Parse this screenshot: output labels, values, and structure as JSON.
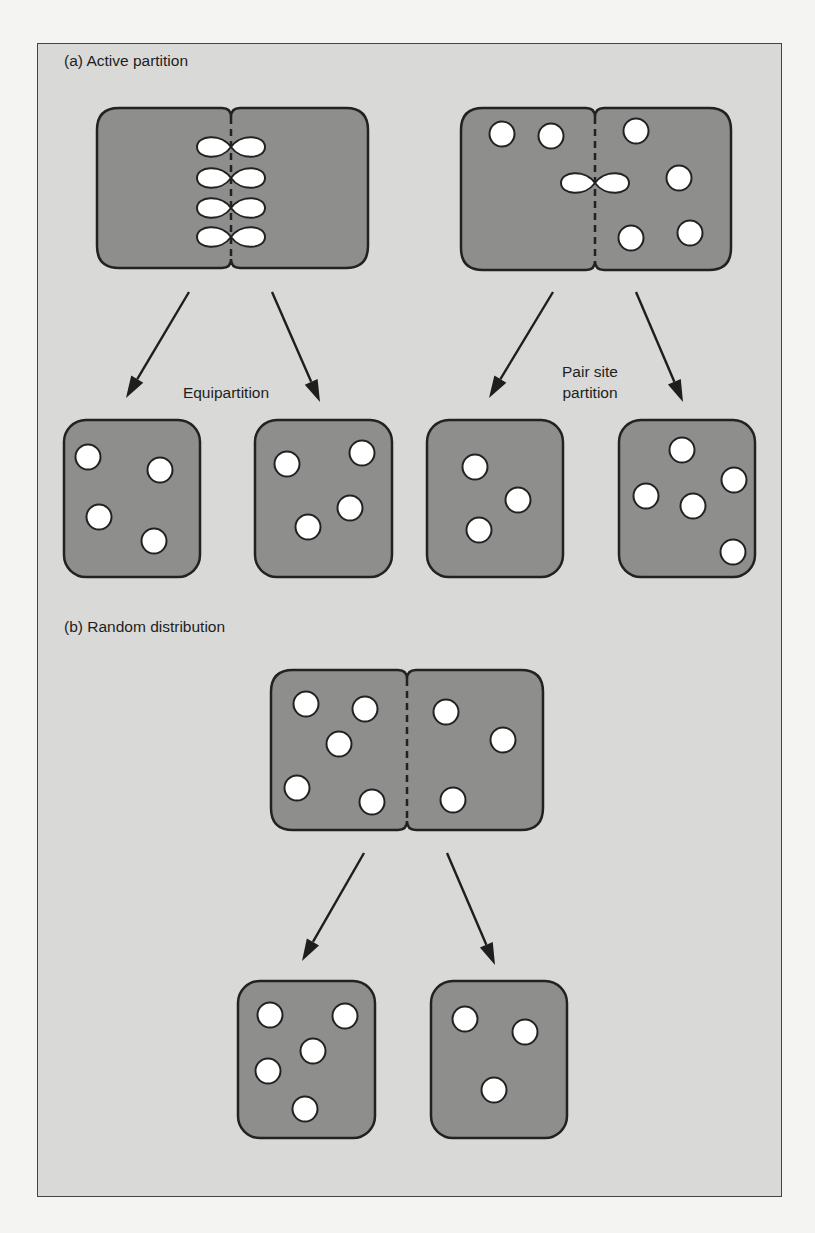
{
  "figure": {
    "panel_a_title": "(a)  Active partition",
    "panel_b_title": "(b) Random distribution",
    "equipartition_label": "Equipartition",
    "pair_site_label_line1": "Pair site",
    "pair_site_label_line2": "partition"
  },
  "colors": {
    "frame_bg": "#d9d9d7",
    "cell_fill": "#8e8e8c",
    "outline": "#222222",
    "particle_fill": "#ffffff"
  },
  "cells": {
    "dividing": [
      {
        "id": "active-equipartition-parent",
        "x": 97,
        "y": 108,
        "w": 271,
        "h": 160,
        "division_x": 231,
        "pairs_y": [
          147,
          178,
          208,
          237
        ],
        "particles": []
      },
      {
        "id": "active-pairsite-parent",
        "x": 461,
        "y": 108,
        "w": 270,
        "h": 162,
        "division_x": 595,
        "pairs_y": [
          183
        ],
        "particles": [
          [
            502,
            134
          ],
          [
            551,
            136
          ],
          [
            636,
            131
          ],
          [
            679,
            178
          ],
          [
            690,
            233
          ],
          [
            631,
            238
          ]
        ]
      },
      {
        "id": "random-parent",
        "x": 271,
        "y": 670,
        "w": 272,
        "h": 160,
        "division_x": 407,
        "pairs_y": [],
        "particles": [
          [
            306,
            704
          ],
          [
            365,
            709
          ],
          [
            339,
            744
          ],
          [
            297,
            788
          ],
          [
            372,
            802
          ],
          [
            446,
            712
          ],
          [
            503,
            740
          ],
          [
            453,
            800
          ]
        ]
      }
    ],
    "daughters": [
      {
        "id": "equipartition-daughter-1",
        "x": 64,
        "y": 420,
        "w": 136,
        "h": 157,
        "particles": [
          [
            88,
            457
          ],
          [
            160,
            470
          ],
          [
            99,
            517
          ],
          [
            154,
            541
          ]
        ]
      },
      {
        "id": "equipartition-daughter-2",
        "x": 255,
        "y": 420,
        "w": 137,
        "h": 157,
        "particles": [
          [
            287,
            464
          ],
          [
            362,
            453
          ],
          [
            350,
            508
          ],
          [
            308,
            527
          ]
        ]
      },
      {
        "id": "pairsite-daughter-1",
        "x": 427,
        "y": 420,
        "w": 136,
        "h": 157,
        "particles": [
          [
            475,
            467
          ],
          [
            518,
            500
          ],
          [
            479,
            530
          ]
        ]
      },
      {
        "id": "pairsite-daughter-2",
        "x": 619,
        "y": 420,
        "w": 136,
        "h": 157,
        "particles": [
          [
            682,
            450
          ],
          [
            734,
            480
          ],
          [
            646,
            496
          ],
          [
            693,
            506
          ],
          [
            733,
            552
          ]
        ]
      },
      {
        "id": "random-daughter-1",
        "x": 238,
        "y": 981,
        "w": 137,
        "h": 157,
        "particles": [
          [
            270,
            1015
          ],
          [
            345,
            1016
          ],
          [
            313,
            1051
          ],
          [
            268,
            1071
          ],
          [
            305,
            1109
          ]
        ]
      },
      {
        "id": "random-daughter-2",
        "x": 431,
        "y": 981,
        "w": 136,
        "h": 157,
        "particles": [
          [
            465,
            1019
          ],
          [
            525,
            1032
          ],
          [
            494,
            1090
          ]
        ]
      }
    ]
  },
  "arrows": [
    {
      "id": "arrow-equi-left",
      "x1": 189,
      "y1": 292,
      "x2": 126,
      "y2": 398
    },
    {
      "id": "arrow-equi-right",
      "x1": 272,
      "y1": 292,
      "x2": 320,
      "y2": 402
    },
    {
      "id": "arrow-pair-left",
      "x1": 553,
      "y1": 292,
      "x2": 489,
      "y2": 398
    },
    {
      "id": "arrow-pair-right",
      "x1": 636,
      "y1": 292,
      "x2": 683,
      "y2": 402
    },
    {
      "id": "arrow-random-left",
      "x1": 364,
      "y1": 853,
      "x2": 302,
      "y2": 961
    },
    {
      "id": "arrow-random-right",
      "x1": 447,
      "y1": 853,
      "x2": 495,
      "y2": 965
    }
  ]
}
